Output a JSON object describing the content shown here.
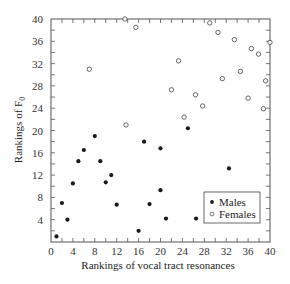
{
  "chart_data": {
    "type": "scatter",
    "title": "",
    "xlabel": "Rankings of vocal tract resonances",
    "ylabel": "Rankings of F",
    "ylabel_subscript": "0",
    "xlim": [
      0,
      40
    ],
    "ylim": [
      0,
      40
    ],
    "xticks": [
      0,
      4,
      8,
      12,
      16,
      20,
      24,
      28,
      32,
      36,
      40
    ],
    "yticks": [
      4,
      8,
      12,
      16,
      20,
      24,
      28,
      32,
      36,
      40
    ],
    "minor_tick_step": 2,
    "grid": false,
    "legend_position": "lower right",
    "series": [
      {
        "name": "Males",
        "marker": "filled-circle",
        "color": "#1a1a1a",
        "points": [
          [
            1,
            1
          ],
          [
            2,
            7
          ],
          [
            3,
            4
          ],
          [
            4,
            10.5
          ],
          [
            5,
            14.5
          ],
          [
            6,
            16.5
          ],
          [
            8,
            19
          ],
          [
            9,
            14.5
          ],
          [
            10,
            10.7
          ],
          [
            11,
            12
          ],
          [
            12,
            6.7
          ],
          [
            16,
            2
          ],
          [
            17,
            18
          ],
          [
            18,
            6.8
          ],
          [
            20,
            16.8
          ],
          [
            20,
            9.3
          ],
          [
            21,
            4.2
          ],
          [
            25,
            20.4
          ],
          [
            26.5,
            4.2
          ],
          [
            32.5,
            13.2
          ]
        ]
      },
      {
        "name": "Females",
        "marker": "open-circle",
        "color": "#555555",
        "points": [
          [
            7,
            31
          ],
          [
            13.5,
            40
          ],
          [
            15.5,
            38.5
          ],
          [
            13.7,
            21
          ],
          [
            22,
            27.3
          ],
          [
            23.3,
            32.5
          ],
          [
            24.3,
            22.4
          ],
          [
            26.4,
            26.4
          ],
          [
            27.7,
            24.4
          ],
          [
            29,
            39.3
          ],
          [
            30.5,
            37.6
          ],
          [
            31.3,
            29.3
          ],
          [
            33.5,
            36.3
          ],
          [
            34.6,
            30.6
          ],
          [
            36,
            25.8
          ],
          [
            36.6,
            34.7
          ],
          [
            37.9,
            33.7
          ],
          [
            38.8,
            23.9
          ],
          [
            39.2,
            28.9
          ],
          [
            40,
            35.8
          ]
        ]
      }
    ]
  }
}
